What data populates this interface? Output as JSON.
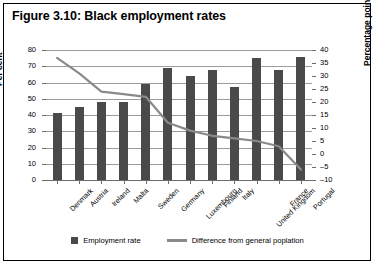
{
  "figure": {
    "title": "Figure 3.10: Black employment rates"
  },
  "legend": {
    "bar_label": "Employment rate",
    "line_label": "Difference from general poplation"
  },
  "axes": {
    "left_title": "Per cent",
    "right_title": "Percentage points",
    "left_ticks": [
      "0",
      "10",
      "20",
      "30",
      "40",
      "50",
      "60",
      "70",
      "80"
    ],
    "right_ticks": [
      "-10",
      "-5",
      "0",
      "5",
      "10",
      "15",
      "20",
      "25",
      "30",
      "35",
      "40"
    ]
  },
  "chart_data": {
    "type": "bar",
    "title": "Figure 3.10: Black employment rates",
    "xlabel": "",
    "ylabel": "Per cent",
    "y2label": "Percentage points",
    "ylim": [
      0,
      80
    ],
    "y2lim": [
      -10,
      40
    ],
    "grid": true,
    "legend_position": "bottom",
    "categories": [
      "Denmark",
      "Austria",
      "Ireland",
      "Malta",
      "Sweden",
      "Germany",
      "Luxembourg",
      "Finland",
      "Italy",
      "United Kingdom",
      "France",
      "Portugal"
    ],
    "series": [
      {
        "name": "Employment rate",
        "type": "bar",
        "axis": "left",
        "unit": "Per cent",
        "color": "#4a4a4a",
        "values": [
          41,
          45,
          48,
          48,
          59,
          69,
          64,
          68,
          57,
          75,
          68,
          76
        ]
      },
      {
        "name": "Difference from general poplation",
        "type": "line",
        "axis": "right",
        "unit": "Percentage points",
        "color": "#8a8a8a",
        "values": [
          37,
          31,
          24,
          23,
          22,
          12,
          9,
          7,
          6,
          5,
          3,
          -6
        ]
      }
    ]
  }
}
